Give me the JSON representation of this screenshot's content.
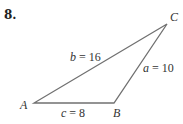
{
  "problem": {
    "number": "8."
  },
  "triangle": {
    "vertices": {
      "A": {
        "label": "A",
        "x": 34,
        "y": 103
      },
      "B": {
        "label": "B",
        "x": 114,
        "y": 103
      },
      "C": {
        "label": "C",
        "x": 167,
        "y": 24
      }
    },
    "sides": {
      "a": {
        "var": "a",
        "eq": " = 10",
        "value": 10
      },
      "b": {
        "var": "b",
        "eq": " = 16",
        "value": 16
      },
      "c": {
        "var": "c",
        "eq": " = 8",
        "value": 8
      }
    },
    "stroke_color": "#707070"
  }
}
